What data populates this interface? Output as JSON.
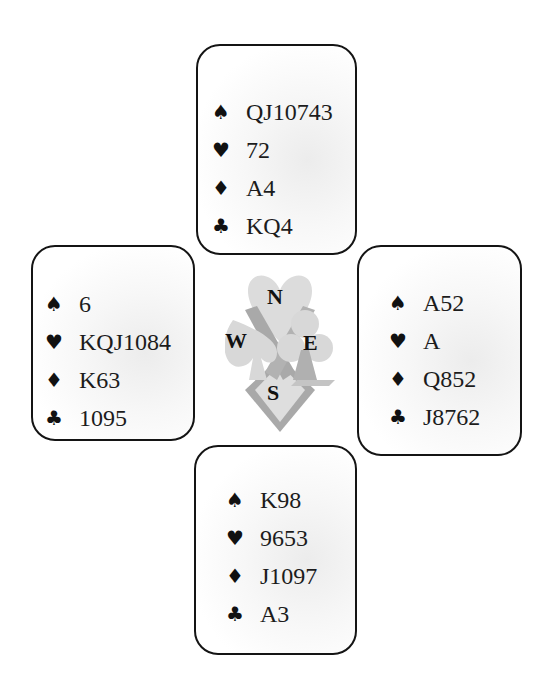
{
  "diagram": {
    "type": "bridge-deal",
    "hands": {
      "north": {
        "label": "N",
        "spades": "QJ10743",
        "hearts": "72",
        "diamonds": "A4",
        "clubs": "KQ4"
      },
      "west": {
        "label": "W",
        "spades": "6",
        "hearts": "KQJ1084",
        "diamonds": "K63",
        "clubs": "1095"
      },
      "east": {
        "label": "E",
        "spades": "A52",
        "hearts": "A",
        "diamonds": "Q852",
        "clubs": "J8762"
      },
      "south": {
        "label": "S",
        "spades": "K98",
        "hearts": "9653",
        "diamonds": "J1097",
        "clubs": "A3"
      }
    },
    "suit_symbols": {
      "spades": "♠",
      "hearts": "♥",
      "diamonds": "♦",
      "clubs": "♣"
    },
    "compass": {
      "north": "N",
      "west": "W",
      "east": "E",
      "south": "S"
    },
    "colors": {
      "border": "#141414",
      "text": "#1c1c1c",
      "emblem_light": "#dcdcdc",
      "emblem_dark": "#a9a9a9"
    }
  }
}
